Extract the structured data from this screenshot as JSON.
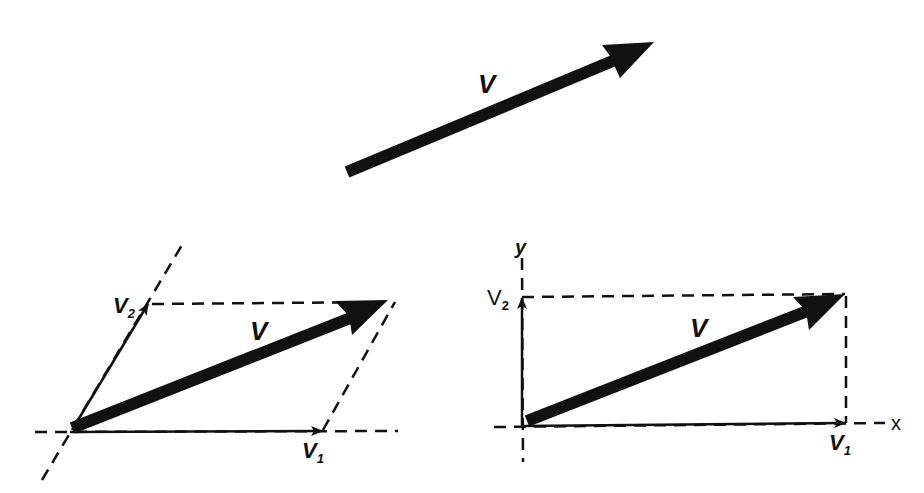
{
  "colors": {
    "ink": "#111111",
    "background": "#ffffff"
  },
  "top_vector": {
    "label": "V",
    "tail": [
      346,
      172
    ],
    "tip": [
      654,
      42
    ]
  },
  "parallelogram_diagram": {
    "resultant_label": "V",
    "component1": {
      "base": "V",
      "sub": "1"
    },
    "component2": {
      "base": "V",
      "sub": "2"
    },
    "origin": [
      70,
      432
    ],
    "v1_tip": [
      322,
      431
    ],
    "v2_tip": [
      148,
      304
    ],
    "resultant_tip": [
      388,
      300
    ]
  },
  "rectangular_diagram": {
    "resultant_label": "V",
    "component1": {
      "base": "V",
      "sub": "1"
    },
    "component2": {
      "base": "V",
      "sub": "2"
    },
    "x_axis_label": "x",
    "y_axis_label": "y",
    "origin": [
      523,
      426
    ],
    "v1_tip": [
      845,
      423
    ],
    "v2_tip": [
      521,
      297
    ],
    "resultant_tip": [
      845,
      294
    ]
  }
}
